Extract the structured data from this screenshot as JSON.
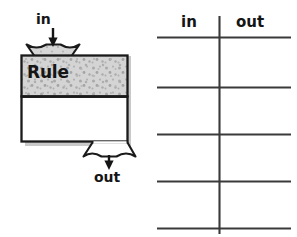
{
  "page": {
    "width": 297,
    "height": 237,
    "background": "#ffffff",
    "ink": "#151515"
  },
  "machine": {
    "title": "Rule",
    "input_label": "in",
    "output_label": "out",
    "hopper_fill": "#d6d6d6",
    "body_top_fill": "#d4d4d4",
    "body_bottom_fill": "#ffffff",
    "outline_color": "#1a1a1a",
    "shadow_color": "#c8c8c8",
    "speckle_color": "#a9a9a9",
    "input_arrow": "down-arrow",
    "output_arrow": "down-arrow"
  },
  "table": {
    "columns": [
      {
        "label": "in"
      },
      {
        "label": "out"
      }
    ],
    "rows": [
      {
        "in": "",
        "out": ""
      },
      {
        "in": "",
        "out": ""
      },
      {
        "in": "",
        "out": ""
      },
      {
        "in": "",
        "out": ""
      }
    ],
    "row_count": 4,
    "rule_color": "#3a3a3a",
    "divider": "vertical-line"
  },
  "clipped_text": {
    "top_fragment": ""
  }
}
